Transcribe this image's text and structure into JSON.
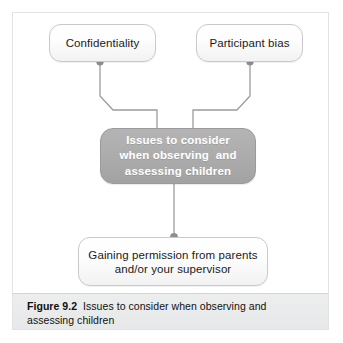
{
  "figure": {
    "caption_label": "Figure 9.2",
    "caption_body": "Issues to consider when observing and assessing children"
  },
  "diagram": {
    "type": "flowchart",
    "nodes": [
      {
        "id": "confidentiality",
        "label": "Confidentiality",
        "style": "light",
        "x": 49,
        "y": 24,
        "w": 107,
        "h": 38
      },
      {
        "id": "participant-bias",
        "label": "Participant bias",
        "style": "light",
        "x": 196,
        "y": 24,
        "w": 107,
        "h": 38
      },
      {
        "id": "central",
        "label": "Issues to consider\nwhen observing  and\nassessing children",
        "style": "dark",
        "x": 100,
        "y": 128,
        "w": 156,
        "h": 56
      },
      {
        "id": "gaining-permission",
        "label": "Gaining permission from parents\nand/or your supervisor",
        "style": "light",
        "x": 78,
        "y": 237,
        "w": 190,
        "h": 49
      }
    ],
    "connectors": [
      {
        "id": "confidentiality-to-central",
        "from": "confidentiality",
        "to": "central"
      },
      {
        "id": "participant-bias-to-central",
        "from": "participant-bias",
        "to": "central"
      },
      {
        "id": "central-to-gaining-permission",
        "from": "central",
        "to": "gaining-permission"
      }
    ],
    "colors": {
      "line": "#9c9c9c",
      "dot": "#8e8e8e",
      "node_light_fill": "#fbfbfb",
      "node_light_border": "#c9c9c9",
      "node_dark_fill": "#adadad",
      "node_dark_text": "#ffffff",
      "caption_band": "#eceded",
      "frame_border": "#e3e3e3"
    }
  }
}
